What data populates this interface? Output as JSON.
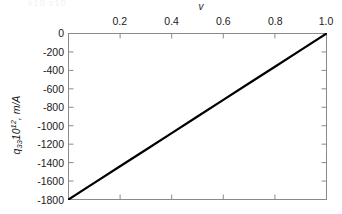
{
  "figure": {
    "background_color": "#ffffff",
    "axis_color": "#808080",
    "line_color": "#000000",
    "text_color": "#1a1a1a",
    "artifact_text": "x10  x10"
  },
  "axes": {
    "x_title": "v",
    "x_title_position": "top",
    "y_title_plain": "q33 10^12, m/A",
    "y_symbol": "q",
    "y_subscript": "33",
    "y_factor": "10",
    "y_exponent": "12",
    "y_units": ", m/A",
    "x_ticks": [
      "0.2",
      "0.4",
      "0.6",
      "0.8",
      "1.0"
    ],
    "x_tick_values": [
      0.2,
      0.4,
      0.6,
      0.8,
      1.0
    ],
    "y_ticks": [
      "0",
      "-200",
      "-400",
      "-600",
      "-800",
      "-1000",
      "-1200",
      "-1400",
      "-1600",
      "-1800"
    ],
    "y_tick_values": [
      0,
      -200,
      -400,
      -600,
      -800,
      -1000,
      -1200,
      -1400,
      -1600,
      -1800
    ]
  },
  "chart_data": {
    "type": "line",
    "title": "",
    "subtitle": "",
    "xlabel": "v",
    "ylabel": "q33 10^12, m/A",
    "xlim": [
      0,
      1.0
    ],
    "ylim": [
      -1800,
      0
    ],
    "grid": false,
    "legend": null,
    "x_axis_position": "top",
    "x_tick_labels": [
      "0.2",
      "0.4",
      "0.6",
      "0.8",
      "1.0"
    ],
    "y_tick_labels": [
      "0",
      "-200",
      "-400",
      "-600",
      "-800",
      "-1000",
      "-1200",
      "-1400",
      "-1600",
      "-1800"
    ],
    "series": [
      {
        "name": "q33",
        "color": "#000000",
        "line_width": 2,
        "x": [
          0.0,
          0.1,
          0.2,
          0.3,
          0.4,
          0.5,
          0.6,
          0.7,
          0.8,
          0.9,
          1.0
        ],
        "values": [
          -1800,
          -1620,
          -1440,
          -1260,
          -1080,
          -900,
          -720,
          -540,
          -360,
          -180,
          0
        ]
      }
    ],
    "annotations": []
  }
}
